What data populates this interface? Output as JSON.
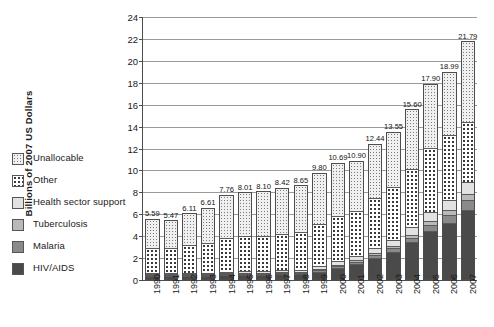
{
  "chart_data": {
    "type": "bar",
    "subtype": "stacked-vertical",
    "title": "",
    "xlabel": "",
    "ylabel": "Billions of 2007 US Dollars",
    "ylim": [
      0,
      24
    ],
    "ytick_step": 2,
    "yticks": [
      "0",
      "2",
      "4",
      "6",
      "8",
      "10",
      "12",
      "14",
      "16",
      "18",
      "20",
      "22",
      "24"
    ],
    "grid": true,
    "legend_position": "left-outside",
    "categories": [
      "1990",
      "1991",
      "1992",
      "1993",
      "1994",
      "1995",
      "1996",
      "1997",
      "1998",
      "1999",
      "2000",
      "2001",
      "2002",
      "2003",
      "2004",
      "2005",
      "2006",
      "2007"
    ],
    "totals": [
      5.59,
      5.47,
      6.11,
      6.61,
      7.76,
      8.01,
      8.1,
      8.42,
      8.65,
      9.8,
      10.69,
      10.9,
      12.44,
      13.55,
      15.6,
      17.9,
      18.99,
      21.79
    ],
    "total_labels": [
      "5.59",
      "5.47",
      "6.11",
      "6.61",
      "7.76",
      "8.01",
      "8.10",
      "8.42",
      "8.65",
      "9.80",
      "10.69",
      "10.90",
      "12.44",
      "13.55",
      "15.60",
      "17.90",
      "18.99",
      "21.79"
    ],
    "series": [
      {
        "name": "HIV/AIDS",
        "color": "#4a4a4a",
        "pattern": "solid-dark",
        "values": [
          0.15,
          0.16,
          0.18,
          0.2,
          0.24,
          0.27,
          0.3,
          0.34,
          0.4,
          0.6,
          0.95,
          1.3,
          1.9,
          2.45,
          3.3,
          4.3,
          5.1,
          6.3
        ]
      },
      {
        "name": "Malaria",
        "color": "#8a8a8a",
        "pattern": "solid-mid",
        "values": [
          0.05,
          0.05,
          0.06,
          0.06,
          0.07,
          0.08,
          0.08,
          0.09,
          0.1,
          0.13,
          0.17,
          0.2,
          0.25,
          0.3,
          0.4,
          0.55,
          0.7,
          0.85
        ]
      },
      {
        "name": "Tuberculosis",
        "color": "#b9b9b9",
        "pattern": "solid-light",
        "values": [
          0.04,
          0.04,
          0.05,
          0.05,
          0.06,
          0.06,
          0.07,
          0.07,
          0.08,
          0.1,
          0.13,
          0.15,
          0.2,
          0.25,
          0.3,
          0.4,
          0.45,
          0.55
        ]
      },
      {
        "name": "Health sector support",
        "color": "#e2e2e2",
        "pattern": "plain",
        "values": [
          0.1,
          0.1,
          0.12,
          0.13,
          0.15,
          0.16,
          0.17,
          0.18,
          0.2,
          0.25,
          0.3,
          0.35,
          0.45,
          0.55,
          0.7,
          0.85,
          0.95,
          1.1
        ]
      },
      {
        "name": "Other",
        "color": "#ffffff",
        "pattern": "big-dots",
        "values": [
          2.45,
          2.4,
          2.65,
          2.8,
          3.2,
          3.3,
          3.33,
          3.45,
          3.52,
          3.92,
          4.24,
          4.2,
          4.64,
          4.9,
          5.4,
          5.9,
          5.99,
          5.6
        ]
      },
      {
        "name": "Unallocable",
        "color": "#f0f0f0",
        "pattern": "fine-dots",
        "values": [
          2.8,
          2.72,
          3.05,
          3.37,
          4.04,
          4.14,
          4.15,
          4.29,
          4.35,
          4.8,
          4.9,
          4.7,
          5.0,
          5.1,
          5.5,
          5.9,
          5.8,
          7.39
        ]
      }
    ]
  },
  "legend": {
    "items": [
      {
        "label": "Unallocable",
        "swatch": "pat-unalloc"
      },
      {
        "label": "Other",
        "swatch": "pat-other"
      },
      {
        "label": "Health sector support",
        "swatch": "pat-health"
      },
      {
        "label": "Tuberculosis",
        "swatch": "pat-tb"
      },
      {
        "label": "Malaria",
        "swatch": "pat-mal"
      },
      {
        "label": "HIV/AIDS",
        "swatch": "pat-hiv"
      }
    ]
  }
}
